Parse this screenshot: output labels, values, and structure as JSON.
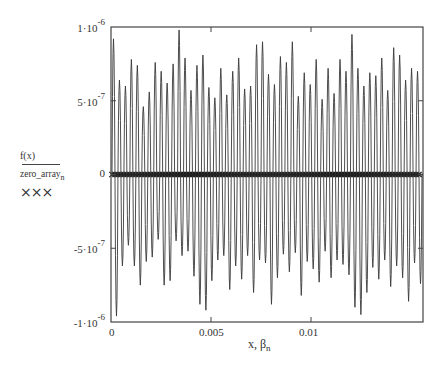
{
  "chart_data": {
    "type": "line",
    "title": "",
    "xlabel": "x, β_n",
    "ylabel": "f(x) / zero_array_n",
    "xlim": [
      0,
      0.0156
    ],
    "ylim": [
      -1e-06,
      1e-06
    ],
    "grid": false,
    "x_ticks": [
      {
        "value": 0,
        "label": "0"
      },
      {
        "value": 0.005,
        "label": "0.005"
      },
      {
        "value": 0.01,
        "label": "0.01"
      }
    ],
    "y_ticks": [
      {
        "value": 1e-06,
        "label": "1·10",
        "exp": "-6"
      },
      {
        "value": 5e-07,
        "label": "5·10",
        "exp": "-7"
      },
      {
        "value": 0,
        "label": "0",
        "exp": ""
      },
      {
        "value": -5e-07,
        "label": "-5·10",
        "exp": "-7"
      },
      {
        "value": -1e-06,
        "label": "-1·10",
        "exp": "-6"
      }
    ],
    "series": [
      {
        "name": "f(x)",
        "style": "solid line",
        "color": "#333333",
        "description": "rapid oscillation, ~52 cycles over 0..0.0156, peak amplitudes vary between ~4.5e-7 and ~1e-6",
        "cycles": 52,
        "peak_amplitudes": [
          0.92,
          0.64,
          0.6,
          0.78,
          0.74,
          0.46,
          0.56,
          0.76,
          0.7,
          0.62,
          0.75,
          0.98,
          0.79,
          0.57,
          0.74,
          0.81,
          0.59,
          0.52,
          0.72,
          0.54,
          0.7,
          0.79,
          0.58,
          0.6,
          0.88,
          0.9,
          0.68,
          0.61,
          0.8,
          0.76,
          0.9,
          0.53,
          0.69,
          0.61,
          0.78,
          0.51,
          0.72,
          0.55,
          0.78,
          0.7,
          0.95,
          0.72,
          0.6,
          0.69,
          0.67,
          0.79,
          0.57,
          0.86,
          0.81,
          0.64,
          0.72,
          0.7
        ],
        "trough_amplitudes": [
          0.96,
          0.62,
          0.48,
          0.62,
          0.75,
          0.59,
          0.56,
          0.44,
          0.75,
          0.72,
          0.45,
          0.55,
          0.52,
          0.69,
          0.88,
          0.92,
          0.72,
          0.58,
          0.55,
          0.78,
          0.62,
          0.71,
          0.55,
          0.8,
          0.58,
          0.6,
          0.88,
          0.7,
          0.54,
          0.66,
          0.53,
          0.82,
          0.59,
          0.64,
          0.73,
          0.52,
          0.7,
          0.58,
          0.61,
          0.68,
          0.9,
          0.95,
          0.8,
          0.63,
          0.71,
          0.58,
          0.76,
          0.62,
          0.7,
          0.86,
          0.6,
          0.74
        ]
      },
      {
        "name": "zero_array_n",
        "style": "× markers",
        "color": "#222222",
        "description": "markers at y = 0 at each zero crossing β_n",
        "y_value": 0,
        "count": 104
      }
    ],
    "legend": {
      "position": "left",
      "entries": [
        {
          "label": "f(x)",
          "style": "line"
        },
        {
          "label": "zero_array",
          "subscript": "n",
          "style": "×××"
        }
      ]
    }
  },
  "labels": {
    "legend_f": "f(x)",
    "legend_zero": "zero_array",
    "legend_zero_sub": "n",
    "legend_marks": "×××",
    "axis_x": "x, β",
    "axis_x_sub": "n"
  }
}
